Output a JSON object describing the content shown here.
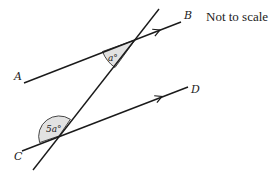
{
  "note": "Not to scale",
  "points": {
    "A": "A",
    "B": "B",
    "C": "C",
    "D": "D"
  },
  "angles": {
    "upper": "a°",
    "lower": "5a°"
  },
  "colors": {
    "line": "#1a1a1a",
    "shade": "#e2e2e2",
    "text": "#222222"
  }
}
